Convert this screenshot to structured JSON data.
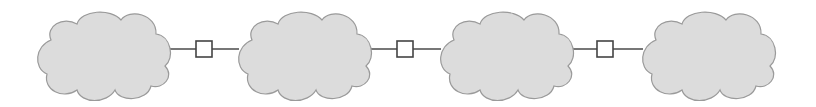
{
  "diagram": {
    "type": "network-chain",
    "colors": {
      "background": "#ffffff",
      "cloud_fill": "#dcdcdc",
      "cloud_stroke": "#9a9a9a",
      "link_stroke": "#555555",
      "node_fill": "#ffffff",
      "node_stroke": "#444444"
    },
    "clouds": [
      {
        "id": "cloud-1",
        "x": 37,
        "y": 10,
        "w": 133,
        "h": 88
      },
      {
        "id": "cloud-2",
        "x": 238,
        "y": 10,
        "w": 133,
        "h": 88
      },
      {
        "id": "cloud-3",
        "x": 440,
        "y": 10,
        "w": 133,
        "h": 88
      },
      {
        "id": "cloud-4",
        "x": 642,
        "y": 10,
        "w": 133,
        "h": 88
      }
    ],
    "nodes": [
      {
        "id": "node-1",
        "x": 196,
        "y": 41,
        "size": 16
      },
      {
        "id": "node-2",
        "x": 397,
        "y": 41,
        "size": 16
      },
      {
        "id": "node-3",
        "x": 597,
        "y": 41,
        "size": 16
      }
    ],
    "links": [
      {
        "from": "cloud-1",
        "to": "node-1",
        "x1": 169,
        "x2": 196,
        "y": 49
      },
      {
        "from": "node-1",
        "to": "cloud-2",
        "x1": 212,
        "x2": 239,
        "y": 49
      },
      {
        "from": "cloud-2",
        "to": "node-2",
        "x1": 370,
        "x2": 397,
        "y": 49
      },
      {
        "from": "node-2",
        "to": "cloud-3",
        "x1": 413,
        "x2": 441,
        "y": 49
      },
      {
        "from": "cloud-3",
        "to": "node-3",
        "x1": 572,
        "x2": 597,
        "y": 49
      },
      {
        "from": "node-3",
        "to": "cloud-4",
        "x1": 613,
        "x2": 643,
        "y": 49
      }
    ]
  }
}
